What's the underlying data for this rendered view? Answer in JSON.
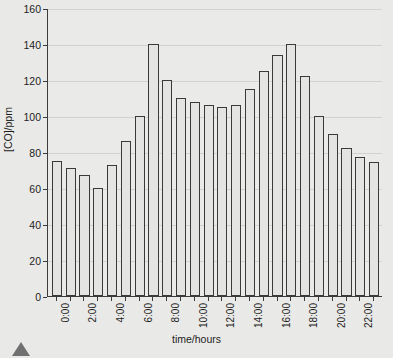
{
  "figure": {
    "background_color": "#e9e9e7",
    "plot_background_color": "#eaeae8",
    "axis_color": "#3b3b3b",
    "grid_color": "#d2d2d0",
    "bar_fill_color": "#e4e4e2",
    "bar_edge_color": "#3a3a3a",
    "top_cropped_caption": "",
    "corner_marker": "triangle-marker"
  },
  "chart_data": {
    "type": "bar",
    "title": "",
    "xlabel": "time/hours",
    "ylabel": "[CO]/ppm",
    "ylim": [
      0,
      160
    ],
    "yticks": [
      0,
      20,
      40,
      60,
      80,
      100,
      120,
      140,
      160
    ],
    "ytick_labels": [
      "0",
      "20",
      "40",
      "60",
      "80",
      "100",
      "120",
      "140",
      "160"
    ],
    "grid": true,
    "legend": null,
    "categories": [
      "0:00",
      "1:00",
      "2:00",
      "3:00",
      "4:00",
      "5:00",
      "6:00",
      "7:00",
      "8:00",
      "9:00",
      "10:00",
      "11:00",
      "12:00",
      "13:00",
      "14:00",
      "15:00",
      "16:00",
      "17:00",
      "18:00",
      "19:00",
      "20:00",
      "21:00",
      "22:00",
      "23:00"
    ],
    "xtick_labels": [
      "0:00",
      "2:00",
      "4:00",
      "6:00",
      "8:00",
      "10:00",
      "12:00",
      "14:00",
      "16:00",
      "18:00",
      "20:00",
      "22:00"
    ],
    "xtick_label_indices": [
      0,
      2,
      4,
      6,
      8,
      10,
      12,
      14,
      16,
      18,
      20,
      22
    ],
    "values": [
      75,
      71,
      67,
      60,
      73,
      86,
      100,
      140,
      120,
      110,
      108,
      106,
      105,
      106,
      115,
      125,
      134,
      140,
      122,
      100,
      90,
      82,
      77.5,
      74.5
    ]
  }
}
